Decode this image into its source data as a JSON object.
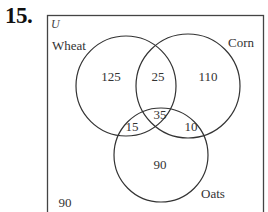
{
  "problem": {
    "number": "15."
  },
  "diagram": {
    "type": "venn-3",
    "universe_label": "U",
    "sets": [
      {
        "name": "Wheat",
        "label": "Wheat"
      },
      {
        "name": "Corn",
        "label": "Corn"
      },
      {
        "name": "Oats",
        "label": "Oats"
      }
    ],
    "regions": {
      "wheat_only": "125",
      "wheat_corn_only": "25",
      "corn_only": "110",
      "wheat_oats_only": "15",
      "all_three": "35",
      "corn_oats_only": "10",
      "oats_only": "90",
      "outside": "90"
    },
    "colors": {
      "stroke": "#333333",
      "background": "#ffffff"
    }
  }
}
